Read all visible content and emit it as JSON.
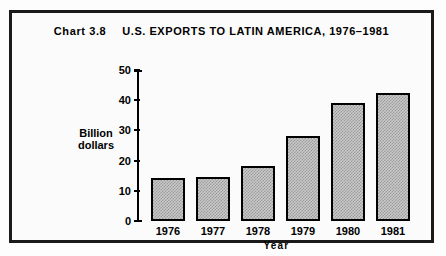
{
  "figure": {
    "chart_number_label": "Chart 3.8",
    "title_main": "U.S. EXPORTS TO LATIN AMERICA, 1976–1981",
    "full_title": "Chart 3.8    U.S. EXPORTS TO LATIN AMERICA, 1976–1981",
    "frame_color": "#1a1a1a",
    "bar_fill_color": "#c9c9c9",
    "bar_outline_color": "#000000",
    "background_color": "#fbfbfb"
  },
  "chart_data": {
    "type": "bar",
    "categories": [
      "1976",
      "1977",
      "1978",
      "1979",
      "1980",
      "1981"
    ],
    "values": [
      14.2,
      14.6,
      18.2,
      28.1,
      39.0,
      42.4
    ],
    "xlabel": "Year",
    "ylabel": "Billion dollars",
    "ylabel_lines": [
      "Billion",
      "dollars"
    ],
    "ylim": [
      0,
      50
    ],
    "yticks": [
      0,
      10,
      20,
      30,
      40,
      50
    ],
    "ytick_labels": [
      "0",
      "10",
      "20",
      "30",
      "40",
      "50"
    ],
    "grid": false,
    "legend": false,
    "series": [
      {
        "name": "U.S. exports to Latin America",
        "values": [
          14.2,
          14.6,
          18.2,
          28.1,
          39.0,
          42.4
        ]
      }
    ]
  }
}
